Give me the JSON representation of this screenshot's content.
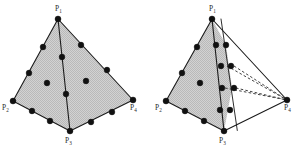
{
  "figure": {
    "canvas": {
      "width": 304,
      "height": 147
    },
    "style": {
      "background_color": "#ffffff",
      "face_fill_color": "#c8c8c8",
      "edge_color": "#1a1a1a",
      "node_color": "#111111",
      "label_color": "#2b2b2b",
      "hidden_edge_style": "dashed"
    },
    "panels": [
      {
        "id": "left",
        "name": "tetrahedron-left",
        "caption": "",
        "vertices": [
          {
            "id": "p1",
            "label": "P",
            "subscript": "1",
            "x": 58,
            "y": 19
          },
          {
            "id": "p2",
            "label": "P",
            "subscript": "2",
            "x": 13,
            "y": 101
          },
          {
            "id": "p3",
            "label": "P",
            "subscript": "3",
            "x": 70,
            "y": 131
          },
          {
            "id": "p4",
            "label": "P",
            "subscript": "4",
            "x": 133,
            "y": 100
          }
        ],
        "label_positions": [
          {
            "id": "p1",
            "x": 55,
            "y": 11
          },
          {
            "id": "p2",
            "x": 4,
            "y": 108
          },
          {
            "id": "p3",
            "x": 66,
            "y": 142
          },
          {
            "id": "p4",
            "x": 130,
            "y": 108
          }
        ],
        "edges": [
          {
            "from": "p1",
            "to": "p2",
            "style": "solid"
          },
          {
            "from": "p1",
            "to": "p4",
            "style": "solid"
          },
          {
            "from": "p2",
            "to": "p3",
            "style": "solid"
          },
          {
            "from": "p3",
            "to": "p4",
            "style": "solid"
          },
          {
            "from": "p1",
            "to": "p3",
            "style": "solid"
          }
        ],
        "faces": [
          {
            "id": "front-left",
            "vertices": [
              "p1",
              "p2",
              "p3"
            ]
          },
          {
            "id": "front-right",
            "vertices": [
              "p1",
              "p3",
              "p4"
            ]
          }
        ],
        "nodes": [
          {
            "x": 58,
            "y": 19,
            "type": "vertex"
          },
          {
            "x": 13,
            "y": 101,
            "type": "vertex"
          },
          {
            "x": 70,
            "y": 131,
            "type": "vertex"
          },
          {
            "x": 133,
            "y": 100,
            "type": "vertex"
          },
          {
            "x": 43,
            "y": 47,
            "type": "edge"
          },
          {
            "x": 29,
            "y": 73,
            "type": "edge"
          },
          {
            "x": 81,
            "y": 45,
            "type": "edge"
          },
          {
            "x": 107,
            "y": 70,
            "type": "edge"
          },
          {
            "x": 32,
            "y": 111,
            "type": "edge"
          },
          {
            "x": 50,
            "y": 121,
            "type": "edge"
          },
          {
            "x": 91,
            "y": 122,
            "type": "edge"
          },
          {
            "x": 112,
            "y": 112,
            "type": "edge"
          },
          {
            "x": 62,
            "y": 57,
            "type": "edge"
          },
          {
            "x": 66,
            "y": 94,
            "type": "edge"
          },
          {
            "x": 47,
            "y": 83,
            "type": "face"
          },
          {
            "x": 86,
            "y": 81,
            "type": "face"
          }
        ]
      },
      {
        "id": "right",
        "name": "tetrahedron-right",
        "caption": "",
        "vertices": [
          {
            "id": "p1",
            "label": "P",
            "subscript": "1",
            "x": 212,
            "y": 19
          },
          {
            "id": "p2",
            "label": "P",
            "subscript": "2",
            "x": 166,
            "y": 101
          },
          {
            "id": "p3",
            "label": "P",
            "subscript": "3",
            "x": 224,
            "y": 131
          },
          {
            "id": "p4",
            "label": "P",
            "subscript": "4",
            "x": 287,
            "y": 100
          }
        ],
        "label_positions": [
          {
            "id": "p1",
            "x": 209,
            "y": 11
          },
          {
            "id": "p2",
            "x": 157,
            "y": 108
          },
          {
            "id": "p3",
            "x": 220,
            "y": 142
          },
          {
            "id": "p4",
            "x": 284,
            "y": 108
          }
        ],
        "edges": [
          {
            "from": "p1",
            "to": "p2",
            "style": "solid"
          },
          {
            "from": "p1",
            "to": "p4",
            "style": "solid"
          },
          {
            "from": "p2",
            "to": "p3",
            "style": "solid"
          },
          {
            "from": "p3",
            "to": "p4",
            "style": "solid"
          },
          {
            "from": "p1",
            "to": "p3",
            "style": "solid"
          }
        ],
        "faces": [
          {
            "id": "front-left",
            "vertices": [
              "p1",
              "p2",
              "p3"
            ]
          }
        ],
        "collapsed_edges": [
          {
            "from": "p1",
            "to": "p3",
            "style": "solid",
            "note": "second collapsed edge"
          }
        ],
        "hidden_edges": [
          {
            "from_x": 227,
            "from_y": 66,
            "to_x": 287,
            "to_y": 100,
            "style": "dashed"
          },
          {
            "from_x": 227,
            "from_y": 88,
            "to_x": 287,
            "to_y": 100,
            "style": "dashed"
          },
          {
            "from_x": 232,
            "from_y": 66,
            "to_x": 287,
            "to_y": 100,
            "style": "dashed"
          },
          {
            "from_x": 232,
            "from_y": 88,
            "to_x": 287,
            "to_y": 100,
            "style": "dashed"
          }
        ],
        "nodes": [
          {
            "x": 212,
            "y": 19,
            "type": "vertex"
          },
          {
            "x": 166,
            "y": 101,
            "type": "vertex"
          },
          {
            "x": 224,
            "y": 131,
            "type": "vertex"
          },
          {
            "x": 287,
            "y": 100,
            "type": "vertex"
          },
          {
            "x": 197,
            "y": 47,
            "type": "edge"
          },
          {
            "x": 182,
            "y": 73,
            "type": "edge"
          },
          {
            "x": 185,
            "y": 111,
            "type": "edge"
          },
          {
            "x": 204,
            "y": 121,
            "type": "edge"
          },
          {
            "x": 216,
            "y": 45,
            "type": "edge"
          },
          {
            "x": 221,
            "y": 66,
            "type": "edge"
          },
          {
            "x": 222,
            "y": 88,
            "type": "edge"
          },
          {
            "x": 226,
            "y": 45,
            "type": "edge"
          },
          {
            "x": 231,
            "y": 66,
            "type": "edge"
          },
          {
            "x": 234,
            "y": 88,
            "type": "edge"
          },
          {
            "x": 230,
            "y": 110,
            "type": "edge"
          },
          {
            "x": 221,
            "y": 110,
            "type": "edge"
          },
          {
            "x": 200,
            "y": 83,
            "type": "face"
          }
        ]
      }
    ]
  }
}
